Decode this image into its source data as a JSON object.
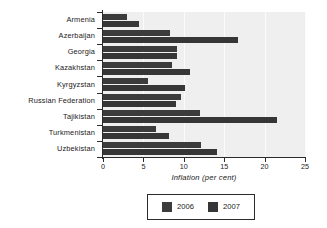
{
  "chart_data": {
    "type": "bar",
    "orientation": "horizontal",
    "title": "",
    "xlabel": "Inflation (per cent)",
    "ylabel": "",
    "xlim": [
      0,
      25
    ],
    "xticks": [
      0,
      5,
      10,
      15,
      20,
      25
    ],
    "xtick_labels": [
      "0",
      "5",
      "10",
      "15",
      "20",
      "25"
    ],
    "grid": true,
    "grid_axis": "x",
    "legend_position": "bottom-center",
    "categories": [
      "Armenia",
      "Azerbaijan",
      "Georgia",
      "Kazakhstan",
      "Kyrgyzstan",
      "Russian Federation",
      "Tajikistan",
      "Turkmenistan",
      "Uzbekistan"
    ],
    "series": [
      {
        "name": "2006",
        "color": "#3b3b3b",
        "values": [
          3.0,
          8.3,
          9.2,
          8.6,
          5.6,
          9.7,
          12.0,
          6.5,
          12.1
        ]
      },
      {
        "name": "2007",
        "color": "#363636",
        "values": [
          4.4,
          16.7,
          9.2,
          10.8,
          10.2,
          9.0,
          21.5,
          8.2,
          14.1
        ]
      }
    ]
  },
  "legend": {
    "entries": [
      {
        "label": "2006",
        "swatch": "legend-swatch-2006"
      },
      {
        "label": "2007",
        "swatch": "legend-swatch-2007"
      }
    ]
  }
}
